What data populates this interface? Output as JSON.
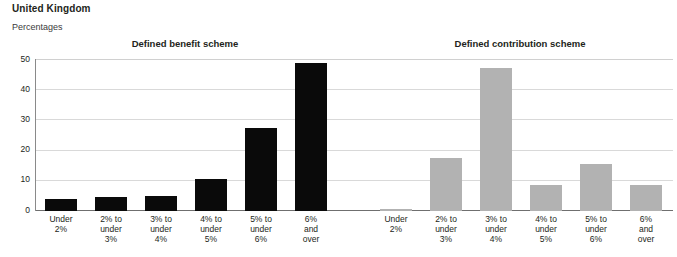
{
  "header": {
    "country": "United Kingdom",
    "units": "Percentages"
  },
  "chart_data": {
    "type": "bar",
    "title": "United Kingdom",
    "subtitle": "Percentages",
    "ylabel": "Percentages",
    "xlabel": "",
    "ylim": [
      0,
      50
    ],
    "yticks": [
      0,
      10,
      20,
      30,
      40,
      50
    ],
    "ytick_labels": [
      "0",
      "10",
      "20",
      "30",
      "40",
      "50"
    ],
    "grid": true,
    "legend_position": "none",
    "categories": [
      "Under\n2%",
      "2% to\nunder\n3%",
      "3% to\nunder\n4%",
      "4% to\nunder\n5%",
      "5% to\nunder\n6%",
      "6%\nand\nover"
    ],
    "panels": [
      {
        "title": "Defined benefit scheme",
        "color": "#0a0a0a",
        "values": [
          4.0,
          4.5,
          5.0,
          10.5,
          27.5,
          49.0
        ]
      },
      {
        "title": "Defined contribution scheme",
        "color": "#b2b2b2",
        "values": [
          0.7,
          17.5,
          47.5,
          8.5,
          15.5,
          8.5
        ]
      }
    ]
  },
  "colors": {
    "defined_benefit_bar": "#0a0a0a",
    "defined_contribution_bar": "#b2b2b2",
    "gridline": "#d9d9d9",
    "axis": "#6f6f6f",
    "text": "#231f20",
    "background": "#ffffff"
  }
}
